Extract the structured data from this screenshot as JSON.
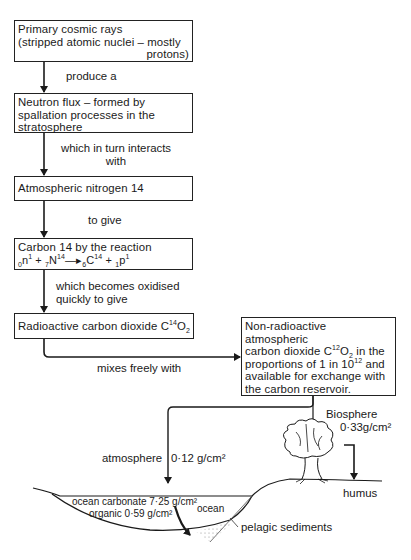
{
  "boxes": {
    "cosmic_rays": {
      "line1": "Primary cosmic rays",
      "line2": "(stripped atomic nuclei – mostly",
      "line3": "protons)"
    },
    "neutron_flux": {
      "line1": "Neutron flux – formed by",
      "line2": "spallation processes in the",
      "line3": "stratosphere"
    },
    "nitrogen": {
      "text": "Atmospheric nitrogen 14"
    },
    "carbon14": {
      "line1": "Carbon 14 by the reaction",
      "eq_n_pre": "0",
      "eq_n": "n",
      "eq_n_sup": "1",
      "eq_plus1": " + ",
      "eq_N_pre": "7",
      "eq_N": "N",
      "eq_N_sup": "14",
      "eq_arrow": "—▸",
      "eq_C_pre": "6",
      "eq_C": "C",
      "eq_C_sup": "14",
      "eq_plus2": " + ",
      "eq_p_pre": "1",
      "eq_p": "p",
      "eq_p_sup": "1"
    },
    "radioactive_co2": {
      "text": "Radioactive carbon dioxide C",
      "sup": "14",
      "o": "O",
      "sub": "2"
    },
    "non_radioactive": {
      "line1": "Non-radioactive atmospheric",
      "line2a": "carbon dioxide C",
      "line2_sup": "12",
      "line2b": "O",
      "line2_sub": "2",
      "line2c": " in the",
      "line3a": "proportions of 1 in 10",
      "line3_sup": "12",
      "line3b": " and",
      "line4": "available for exchange with",
      "line5": "the carbon reservoir."
    }
  },
  "connectors": {
    "produce": "produce a",
    "interacts_1": "which in turn interacts",
    "interacts_2": "with",
    "to_give": "to give",
    "oxidised_1": "which becomes oxidised",
    "oxidised_2": "quickly to give",
    "mixes": "mixes freely with"
  },
  "reservoirs": {
    "biosphere": "Biosphere",
    "biosphere_value": "0·33g/cm²",
    "atmosphere": "atmosphere",
    "atmosphere_value": "0·12 g/cm²",
    "humus": "humus",
    "ocean_carbonate": "ocean carbonate 7·25 g/cm²",
    "organic": "organic 0·59 g/cm²",
    "ocean": "ocean",
    "pelagic": "pelagic sediments"
  },
  "colors": {
    "line": "#1a1a1a",
    "background": "#ffffff"
  }
}
